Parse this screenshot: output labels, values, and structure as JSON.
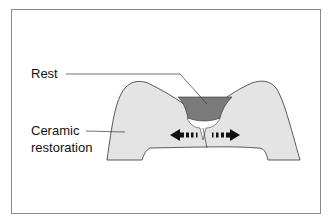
{
  "diagram": {
    "labels": {
      "rest": "Rest",
      "ceramic_line1": "Ceramic",
      "ceramic_line2": "restoration"
    },
    "colors": {
      "restoration_fill": "#e4e4e4",
      "rest_fill": "#7a7a7a",
      "outline": "#333333",
      "arrow": "#111111",
      "frame": "#8a8a8a"
    }
  }
}
